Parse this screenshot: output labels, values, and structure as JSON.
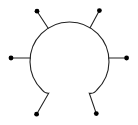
{
  "canvas": {
    "width": 138,
    "height": 125,
    "background_color": "#ffffff"
  },
  "diagram": {
    "stroke_color": "#222222",
    "dot_color": "#000000",
    "stroke_width": 1.1,
    "dot_radius": 2.4,
    "body": {
      "circle_center_x": 69.5,
      "circle_center_y": 61.5,
      "circle_radius": 39.5,
      "path": "M 36.6,114.2 L 48.7,93.2 A 7.5,7.5 0 0 1 42.2,90 A 39.5,39.5 0 1 1 96.8,90 A 7.5,7.5 0 0 1 89.3,93.2 L 96.3,113.6"
    },
    "spokes": [
      {
        "name": "spoke-top-left",
        "x1": 37.0,
        "y1": 11.2,
        "x2": 48.2,
        "y2": 28.2
      },
      {
        "name": "spoke-top-right",
        "x1": 99.4,
        "y1": 10.6,
        "x2": 90.1,
        "y2": 27.8
      },
      {
        "name": "spoke-left",
        "x1": 11.0,
        "y1": 58.0,
        "x2": 30.4,
        "y2": 58.0
      },
      {
        "name": "spoke-right",
        "x1": 126.6,
        "y1": 58.0,
        "x2": 108.7,
        "y2": 58.0
      }
    ],
    "dots": [
      {
        "name": "dot-top-left",
        "cx": 37.0,
        "cy": 11.2
      },
      {
        "name": "dot-top-right",
        "cx": 99.4,
        "cy": 10.6
      },
      {
        "name": "dot-left",
        "cx": 11.0,
        "cy": 58.0
      },
      {
        "name": "dot-right",
        "cx": 126.6,
        "cy": 58.0
      },
      {
        "name": "dot-bottom-left",
        "cx": 36.6,
        "cy": 114.2
      },
      {
        "name": "dot-bottom-right",
        "cx": 96.3,
        "cy": 113.6
      }
    ]
  }
}
